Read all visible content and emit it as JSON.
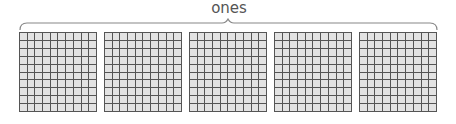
{
  "label": "ones",
  "colors": {
    "cell_fill": "#e3e3e3",
    "grid_line": "#555555",
    "bracket": "#888888",
    "label": "#555555"
  },
  "grids": [
    {
      "name": "hundred-square-1",
      "rows": 10,
      "cols": 10,
      "left": 19
    },
    {
      "name": "hundred-square-2",
      "rows": 10,
      "cols": 10,
      "left": 104
    },
    {
      "name": "hundred-square-3",
      "rows": 10,
      "cols": 10,
      "left": 189
    },
    {
      "name": "hundred-square-4",
      "rows": 10,
      "cols": 10,
      "left": 274
    },
    {
      "name": "hundred-square-5",
      "rows": 10,
      "cols": 10,
      "left": 359
    }
  ]
}
